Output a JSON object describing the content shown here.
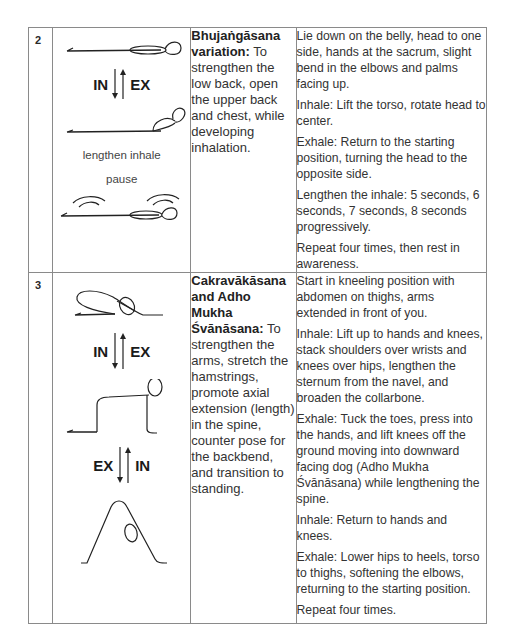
{
  "rows": [
    {
      "number": "2",
      "figure": {
        "arrow_left": "IN",
        "arrow_right": "EX",
        "caption_1": "lengthen inhale",
        "caption_2": "pause"
      },
      "pose_name": "Bhujaṅgāsana variation:",
      "pose_purpose": " To strengthen the low back, open the upper back and chest, while developing inhalation.",
      "instructions": [
        "Lie down on the belly, head to one side, hands at the sacrum, slight bend in the elbows and palms facing up.",
        "Inhale: Lift the torso, rotate head to center.",
        "Exhale: Return to the starting position, turning the head to the opposite side.",
        "Lengthen the inhale: 5 seconds, 6 seconds, 7 seconds, 8 seconds progressively.",
        "Repeat four times, then rest in awareness."
      ]
    },
    {
      "number": "3",
      "figure": {
        "arrow1_left": "IN",
        "arrow1_right": "EX",
        "arrow2_left": "EX",
        "arrow2_right": "IN"
      },
      "pose_name": "Cakravākāsana and Adho Mukha Śvānāsana:",
      "pose_purpose": " To strengthen the arms, stretch the hamstrings, promote axial extension (length) in the spine, counter pose for the backbend, and transition to standing.",
      "instructions": [
        "Start in kneeling position with abdomen on thighs, arms extended in front of you.",
        "Inhale: Lift up to hands and knees, stack shoulders over wrists and knees over hips, lengthen the sternum from the navel, and broaden the collarbone.",
        "Exhale: Tuck the toes, press into the hands, and lift knees off the ground moving into downward facing dog (Adho Mukha Śvānāsana) while lengthening the spine.",
        "Inhale: Return to hands and knees.",
        "Exhale: Lower hips to heels, torso to thighs, softening the elbows, returning to the starting position.",
        "Repeat four times."
      ]
    }
  ]
}
